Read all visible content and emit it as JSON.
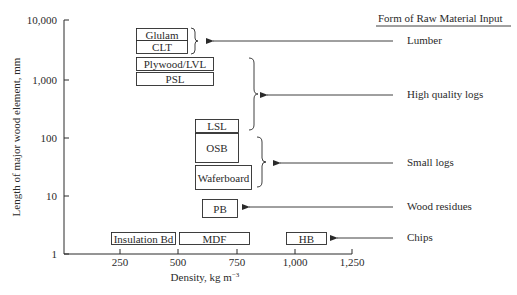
{
  "diagram": {
    "y_axis": {
      "label": "Length of major wood element, mm",
      "ticks": [
        {
          "label": "10,000",
          "y": 20
        },
        {
          "label": "1,000",
          "y": 80
        },
        {
          "label": "100",
          "y": 138
        },
        {
          "label": "10",
          "y": 196
        },
        {
          "label": "1",
          "y": 254
        }
      ]
    },
    "x_axis": {
      "label": "Density, kg m",
      "label_sup": "−3",
      "ticks": [
        {
          "label": "250",
          "x": 120
        },
        {
          "label": "500",
          "x": 178
        },
        {
          "label": "750",
          "x": 237
        },
        {
          "label": "1,000",
          "x": 295
        },
        {
          "label": "1,250",
          "x": 352
        }
      ]
    },
    "products": [
      {
        "label": "Glulam",
        "x": 136,
        "y": 28,
        "w": 51,
        "h": 12
      },
      {
        "label": "CLT",
        "x": 136,
        "y": 40,
        "w": 51,
        "h": 13
      },
      {
        "label": "Plywood/LVL",
        "x": 136,
        "y": 57,
        "w": 77,
        "h": 13
      },
      {
        "label": "PSL",
        "x": 136,
        "y": 72,
        "w": 77,
        "h": 13
      },
      {
        "label": "LSL",
        "x": 195,
        "y": 119,
        "w": 43,
        "h": 13
      },
      {
        "label": "OSB",
        "x": 195,
        "y": 133,
        "w": 43,
        "h": 29
      },
      {
        "label": "Waferboard",
        "x": 195,
        "y": 165,
        "w": 56,
        "h": 24
      },
      {
        "label": "PB",
        "x": 202,
        "y": 199,
        "w": 35,
        "h": 18
      },
      {
        "label": "Insulation Bd",
        "x": 111,
        "y": 232,
        "w": 64,
        "h": 12
      },
      {
        "label": "MDF",
        "x": 179,
        "y": 232,
        "w": 70,
        "h": 12
      },
      {
        "label": "HB",
        "x": 286,
        "y": 232,
        "w": 40,
        "h": 12
      }
    ],
    "legend_title": "Form of Raw Material Input",
    "raw_inputs": [
      {
        "label": "Lumber",
        "y": 41,
        "arrow_from": 393,
        "arrow_to": 213
      },
      {
        "label": "High quality logs",
        "y": 95,
        "arrow_from": 393,
        "arrow_to": 267
      },
      {
        "label": "Small logs",
        "y": 163,
        "arrow_from": 393,
        "arrow_to": 280
      },
      {
        "label": "Wood residues",
        "y": 207,
        "arrow_from": 393,
        "arrow_to": 249
      },
      {
        "label": "Chips",
        "y": 238,
        "arrow_from": 393,
        "arrow_to": 337
      }
    ],
    "colors": {
      "ink": "#2a2a2a",
      "background": "#ffffff"
    }
  }
}
